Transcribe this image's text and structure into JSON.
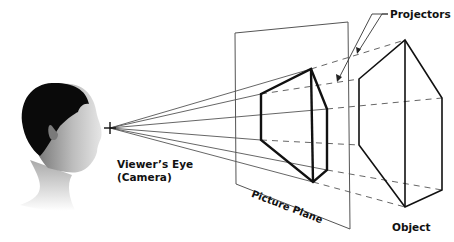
{
  "labels": {
    "projectors": "Projectors",
    "viewers_eye_line1": "Viewer’s Eye",
    "viewers_eye_line2": "(Camera)",
    "picture_plane": "Picture Plane",
    "object": "Object"
  },
  "colors": {
    "background": "#ffffff",
    "line": "#222222",
    "thin_line": "#555555",
    "text": "#111111"
  },
  "geometry": {
    "eye": [
      110,
      128
    ],
    "picture_plane": [
      [
        235,
        33
      ],
      [
        348,
        22
      ],
      [
        350,
        229
      ],
      [
        236,
        184
      ]
    ],
    "projected_shape": [
      [
        261,
        94
      ],
      [
        311,
        69
      ],
      [
        327,
        109
      ],
      [
        327,
        170
      ],
      [
        313,
        182
      ],
      [
        261,
        140
      ]
    ],
    "object_shape": [
      [
        359,
        79
      ],
      [
        405,
        40
      ],
      [
        442,
        98
      ],
      [
        442,
        190
      ],
      [
        405,
        207
      ],
      [
        359,
        145
      ]
    ]
  }
}
